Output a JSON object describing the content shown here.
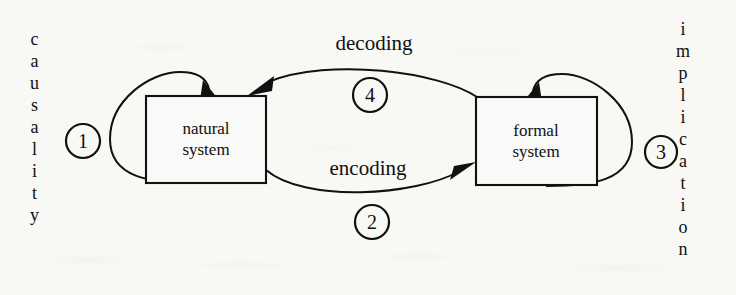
{
  "diagram": {
    "background_color": "#f8f8f5",
    "ink_color": "#111111",
    "nodes": [
      {
        "id": "natural",
        "line1": "natural",
        "line2": "system"
      },
      {
        "id": "formal",
        "line1": "formal",
        "line2": "system"
      }
    ],
    "arcs": [
      {
        "id": "decoding",
        "label": "decoding",
        "number": "4",
        "from": "formal",
        "to": "natural"
      },
      {
        "id": "encoding",
        "label": "encoding",
        "number": "2",
        "from": "natural",
        "to": "formal"
      }
    ],
    "loops": [
      {
        "id": "causality",
        "label": "causality",
        "number": "1",
        "letters": [
          "c",
          "a",
          "u",
          "s",
          "a",
          "l",
          "i",
          "t",
          "y"
        ]
      },
      {
        "id": "implication",
        "label": "implication",
        "number": "3",
        "letters": [
          "i",
          "m",
          "p",
          "l",
          "i",
          "c",
          "a",
          "t",
          "i",
          "o",
          "n"
        ]
      }
    ]
  }
}
